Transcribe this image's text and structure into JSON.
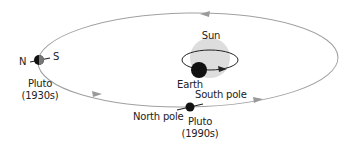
{
  "diagram": {
    "labels": {
      "sun": "Sun",
      "earth": "Earth",
      "north_short": "N",
      "south_short": "S",
      "pluto_1930_name": "Pluto",
      "pluto_1930_year": "(1930s)",
      "south_pole": "South pole",
      "north_pole": "North pole",
      "pluto_1990_name": "Pluto",
      "pluto_1990_year": "(1990s)"
    },
    "colors": {
      "orbit": "#9a9a9a",
      "sun": "#dcdcdc",
      "planet": "#111111",
      "text": "#222222"
    }
  }
}
